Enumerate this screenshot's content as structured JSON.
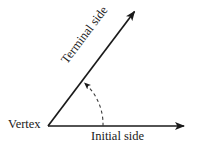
{
  "figure": {
    "type": "angle-diagram",
    "background_color": "#ffffff",
    "stroke_color": "#1a1a1a",
    "labels": {
      "vertex": "Vertex",
      "initial_side": "Initial side",
      "terminal_side": "Terminal side"
    },
    "geometry": {
      "vertex_point": [
        48,
        126
      ],
      "initial_ray_end": [
        188,
        126
      ],
      "terminal_ray_end": [
        137,
        8
      ],
      "terminal_angle_degrees": 53,
      "arc_radius": 55,
      "arc_start_point": [
        103,
        126
      ],
      "arc_end_point": [
        85,
        81
      ],
      "arc_style": "dashed",
      "arrow_direction": "counterclockwise"
    }
  }
}
